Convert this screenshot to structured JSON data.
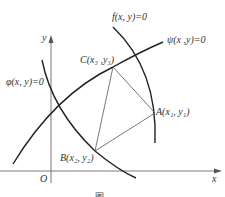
{
  "diagram": {
    "axes": {
      "x_label": "x",
      "y_label": "y",
      "origin_label": "O"
    },
    "curves": [
      {
        "id": "f",
        "label": "f(x, y)=0"
      },
      {
        "id": "psi",
        "label": "ψ(x ,y)=0"
      },
      {
        "id": "phi",
        "label": "φ(x, y)=0"
      }
    ],
    "points": [
      {
        "id": "A",
        "label": "A(x₁, y₁)"
      },
      {
        "id": "B",
        "label": "B(x₂, y₂)"
      },
      {
        "id": "C",
        "label": "C(x₃ ,y₃)"
      }
    ],
    "caption": "图"
  }
}
